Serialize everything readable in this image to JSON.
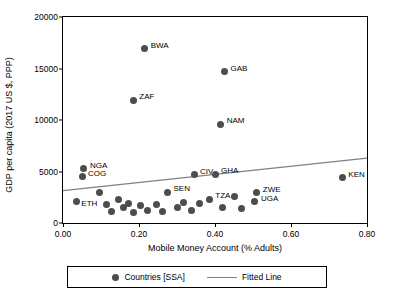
{
  "chart_data": {
    "type": "scatter",
    "title": "",
    "xlabel": "Mobile Money Account (% Adults)",
    "ylabel": "GDP per capita (2017 US $, PPP)",
    "xlim": [
      0.0,
      0.8
    ],
    "ylim": [
      0,
      20000
    ],
    "xticks": [
      "0.00",
      "0.20",
      "0.40",
      "0.60",
      "0.80"
    ],
    "xtick_values": [
      0.0,
      0.2,
      0.4,
      0.6,
      0.8
    ],
    "yticks": [
      "0",
      "5000",
      "10000",
      "15000",
      "20000"
    ],
    "ytick_values": [
      0,
      5000,
      10000,
      15000,
      20000
    ],
    "grid": false,
    "legend_position": "bottom",
    "legend": [
      {
        "label": "Countries [SSA]",
        "marker": "circle",
        "color": "#4d4d4d"
      },
      {
        "label": "Fitted Line",
        "marker": "line",
        "color": "#808080"
      }
    ],
    "series": [
      {
        "name": "Countries [SSA]",
        "points": [
          {
            "label": "BWA",
            "x": 0.215,
            "y": 16900,
            "label_dx": 6,
            "label_dy": -3
          },
          {
            "label": "GAB",
            "x": 0.425,
            "y": 14700,
            "label_dx": 6,
            "label_dy": -3
          },
          {
            "label": "ZAF",
            "x": 0.185,
            "y": 11900,
            "label_dx": 6,
            "label_dy": -3
          },
          {
            "label": "NAM",
            "x": 0.415,
            "y": 9600,
            "label_dx": 6,
            "label_dy": -3
          },
          {
            "label": "KEN",
            "x": 0.735,
            "y": 4400,
            "label_dx": 6,
            "label_dy": -3
          },
          {
            "label": "NGA",
            "x": 0.055,
            "y": 5250,
            "label_dx": 6,
            "label_dy": -3
          },
          {
            "label": "COG",
            "x": 0.05,
            "y": 4500,
            "label_dx": 6,
            "label_dy": -3
          },
          {
            "label": "CIV",
            "x": 0.345,
            "y": 4700,
            "label_dx": 6,
            "label_dy": -3
          },
          {
            "label": "GHA",
            "x": 0.4,
            "y": 4750,
            "label_dx": 6,
            "label_dy": -3
          },
          {
            "label": "ZWE",
            "x": 0.51,
            "y": 2950,
            "label_dx": 6,
            "label_dy": -3
          },
          {
            "label": "UGA",
            "x": 0.505,
            "y": 2050,
            "label_dx": 6,
            "label_dy": -3
          },
          {
            "label": "SEN",
            "x": 0.275,
            "y": 3000,
            "label_dx": 6,
            "label_dy": -3
          },
          {
            "label": "TZA",
            "x": 0.385,
            "y": 2300,
            "label_dx": 6,
            "label_dy": -3
          },
          {
            "label": "ETH",
            "x": 0.035,
            "y": 2100,
            "label_dx": 5,
            "label_dy": 3
          },
          {
            "label": "",
            "x": 0.095,
            "y": 2950,
            "label_dx": 0,
            "label_dy": 0
          },
          {
            "label": "",
            "x": 0.115,
            "y": 1750,
            "label_dx": 0,
            "label_dy": 0
          },
          {
            "label": "",
            "x": 0.128,
            "y": 1100,
            "label_dx": 0,
            "label_dy": 0
          },
          {
            "label": "",
            "x": 0.145,
            "y": 2250,
            "label_dx": 0,
            "label_dy": 0
          },
          {
            "label": "",
            "x": 0.158,
            "y": 1550,
            "label_dx": 0,
            "label_dy": 0
          },
          {
            "label": "",
            "x": 0.172,
            "y": 1900,
            "label_dx": 0,
            "label_dy": 0
          },
          {
            "label": "",
            "x": 0.185,
            "y": 1050,
            "label_dx": 0,
            "label_dy": 0
          },
          {
            "label": "",
            "x": 0.205,
            "y": 1700,
            "label_dx": 0,
            "label_dy": 0
          },
          {
            "label": "",
            "x": 0.222,
            "y": 1250,
            "label_dx": 0,
            "label_dy": 0
          },
          {
            "label": "",
            "x": 0.245,
            "y": 1750,
            "label_dx": 0,
            "label_dy": 0
          },
          {
            "label": "",
            "x": 0.262,
            "y": 1100,
            "label_dx": 0,
            "label_dy": 0
          },
          {
            "label": "",
            "x": 0.3,
            "y": 1500,
            "label_dx": 0,
            "label_dy": 0
          },
          {
            "label": "",
            "x": 0.318,
            "y": 2000,
            "label_dx": 0,
            "label_dy": 0
          },
          {
            "label": "",
            "x": 0.338,
            "y": 1250,
            "label_dx": 0,
            "label_dy": 0
          },
          {
            "label": "",
            "x": 0.36,
            "y": 1850,
            "label_dx": 0,
            "label_dy": 0
          },
          {
            "label": "",
            "x": 0.42,
            "y": 1500,
            "label_dx": 0,
            "label_dy": 0
          },
          {
            "label": "",
            "x": 0.45,
            "y": 2550,
            "label_dx": 0,
            "label_dy": 0
          },
          {
            "label": "",
            "x": 0.47,
            "y": 1450,
            "label_dx": 0,
            "label_dy": 0
          }
        ]
      }
    ],
    "fitted_line": {
      "name": "Fitted Line",
      "x0": 0.0,
      "y0": 3150,
      "x1": 0.8,
      "y1": 6300,
      "color": "#808080"
    }
  }
}
